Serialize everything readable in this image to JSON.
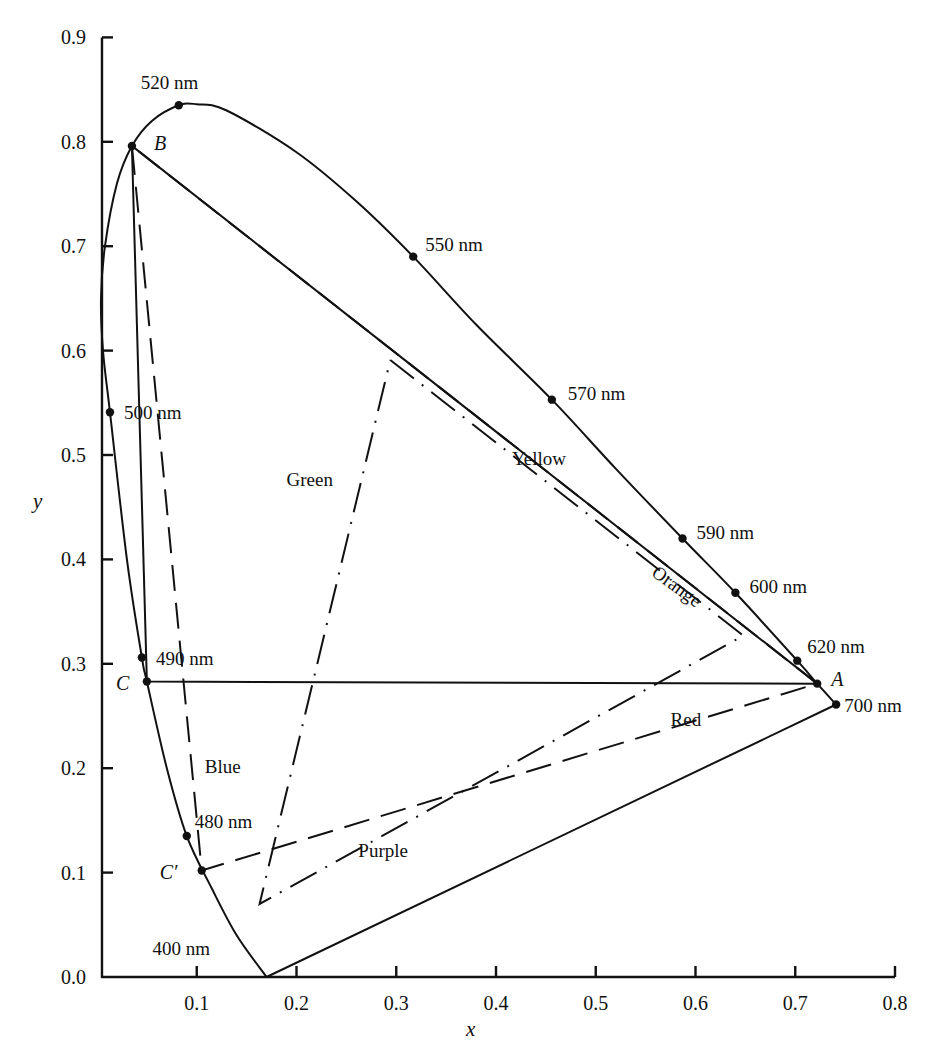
{
  "chart_data": {
    "type": "line",
    "title": "",
    "xlabel": "x",
    "ylabel": "y",
    "xlim": [
      0.0,
      0.8
    ],
    "ylim": [
      0.0,
      0.9
    ],
    "grid": false,
    "x_ticks": [
      "0.1",
      "0.2",
      "0.3",
      "0.4",
      "0.5",
      "0.6",
      "0.7",
      "0.8"
    ],
    "y_ticks": [
      "0.0",
      "0.1",
      "0.2",
      "0.3",
      "0.4",
      "0.5",
      "0.6",
      "0.7",
      "0.8",
      "0.9"
    ],
    "spectrum_locus": {
      "name": "Spectral locus",
      "style": "solid",
      "points": [
        [
          0.17,
          0.0
        ],
        [
          0.14,
          0.04
        ],
        [
          0.115,
          0.085
        ],
        [
          0.09,
          0.135
        ],
        [
          0.07,
          0.2
        ],
        [
          0.05,
          0.283
        ],
        [
          0.045,
          0.306
        ],
        [
          0.03,
          0.4
        ],
        [
          0.013,
          0.541
        ],
        [
          0.006,
          0.6
        ],
        [
          0.004,
          0.65
        ],
        [
          0.008,
          0.7
        ],
        [
          0.02,
          0.76
        ],
        [
          0.035,
          0.796
        ],
        [
          0.055,
          0.82
        ],
        [
          0.082,
          0.835
        ],
        [
          0.1,
          0.836
        ],
        [
          0.13,
          0.83
        ],
        [
          0.2,
          0.79
        ],
        [
          0.26,
          0.743
        ],
        [
          0.317,
          0.69
        ],
        [
          0.38,
          0.625
        ],
        [
          0.456,
          0.553
        ],
        [
          0.52,
          0.487
        ],
        [
          0.587,
          0.42
        ],
        [
          0.64,
          0.368
        ],
        [
          0.702,
          0.303
        ],
        [
          0.722,
          0.281
        ],
        [
          0.741,
          0.261
        ]
      ]
    },
    "purple_line": {
      "name": "Line of purples",
      "style": "solid",
      "points": [
        [
          0.741,
          0.261
        ],
        [
          0.17,
          0.0
        ]
      ]
    },
    "wavelength_markers": [
      {
        "label": "520 nm",
        "x": 0.082,
        "y": 0.835
      },
      {
        "label": "550 nm",
        "x": 0.317,
        "y": 0.69
      },
      {
        "label": "570 nm",
        "x": 0.456,
        "y": 0.553
      },
      {
        "label": "590 nm",
        "x": 0.587,
        "y": 0.42
      },
      {
        "label": "600 nm",
        "x": 0.64,
        "y": 0.368
      },
      {
        "label": "620 nm",
        "x": 0.702,
        "y": 0.303
      },
      {
        "label": "700 nm",
        "x": 0.741,
        "y": 0.261
      },
      {
        "label": "500 nm",
        "x": 0.013,
        "y": 0.541
      },
      {
        "label": "490 nm",
        "x": 0.045,
        "y": 0.306
      },
      {
        "label": "480 nm",
        "x": 0.09,
        "y": 0.135
      },
      {
        "label": "400 nm",
        "x": 0.17,
        "y": 0.0
      }
    ],
    "named_points": [
      {
        "label": "A",
        "x": 0.722,
        "y": 0.281
      },
      {
        "label": "B",
        "x": 0.035,
        "y": 0.796
      },
      {
        "label": "C",
        "x": 0.05,
        "y": 0.283
      },
      {
        "label": "C′",
        "x": 0.105,
        "y": 0.102
      }
    ],
    "series": [
      {
        "name": "Triangle ABC",
        "style": "solid",
        "points": [
          [
            0.722,
            0.281
          ],
          [
            0.035,
            0.796
          ],
          [
            0.05,
            0.283
          ],
          [
            0.722,
            0.281
          ]
        ]
      },
      {
        "name": "Triangle ABC′",
        "style": "dashed",
        "points": [
          [
            0.722,
            0.281
          ],
          [
            0.035,
            0.796
          ],
          [
            0.105,
            0.102
          ],
          [
            0.722,
            0.281
          ]
        ]
      },
      {
        "name": "Color region triangle",
        "style": "dash-dot",
        "points": [
          [
            0.294,
            0.591
          ],
          [
            0.648,
            0.327
          ],
          [
            0.163,
            0.07
          ],
          [
            0.294,
            0.591
          ]
        ]
      }
    ],
    "annotations": [
      {
        "text": "Green",
        "x": 0.19,
        "y": 0.47
      },
      {
        "text": "Yellow",
        "x": 0.416,
        "y": 0.49
      },
      {
        "text": "Orange",
        "x": 0.555,
        "y": 0.385,
        "rotation": 36
      },
      {
        "text": "Red",
        "x": 0.575,
        "y": 0.24
      },
      {
        "text": "Blue",
        "x": 0.108,
        "y": 0.195
      },
      {
        "text": "Purple",
        "x": 0.262,
        "y": 0.115
      }
    ]
  }
}
